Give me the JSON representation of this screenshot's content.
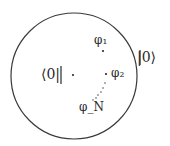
{
  "diagram": {
    "circle": {
      "cx": 74,
      "cy": 76,
      "r": 63,
      "stroke": "#3a3a3a"
    },
    "labels": {
      "bra_zero": "⟨0|",
      "ket_zero": "|0⟩",
      "phi_1": "φ₁",
      "phi_2": "φ₂",
      "phi_n": "φ_N"
    },
    "points": [
      {
        "name": "center",
        "x": 73,
        "y": 75
      },
      {
        "name": "phi_1",
        "x": 103,
        "y": 51
      },
      {
        "name": "phi_2",
        "x": 106,
        "y": 74
      }
    ],
    "dotted_trail": [
      [
        105,
        83
      ],
      [
        103,
        88
      ],
      [
        101,
        92
      ],
      [
        98,
        95
      ],
      [
        96,
        98
      ],
      [
        93,
        100
      ]
    ]
  }
}
